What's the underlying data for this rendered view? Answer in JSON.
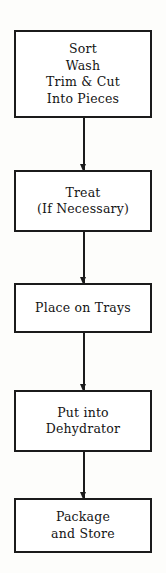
{
  "diagram": {
    "type": "flowchart",
    "orientation": "vertical",
    "box_border_color": "#1b1b1b",
    "box_fill_color": "#ffffff",
    "connector_color": "#1b1b1b",
    "page_background": "#fdfdfb",
    "nodes": [
      {
        "id": "sort-wash-trim",
        "lines": [
          "Sort",
          "Wash",
          "Trim & Cut",
          "Into Pieces"
        ]
      },
      {
        "id": "treat",
        "lines": [
          "Treat",
          "(If Necessary)"
        ]
      },
      {
        "id": "place-on-trays",
        "lines": [
          "Place on Trays"
        ]
      },
      {
        "id": "put-into-dehydrator",
        "lines": [
          "Put into",
          "Dehydrator"
        ]
      },
      {
        "id": "package-and-store",
        "lines": [
          "Package",
          "and Store"
        ]
      }
    ],
    "connectors": [
      {
        "id": "arrow-1",
        "from": "sort-wash-trim",
        "to": "treat",
        "marker": "arrowhead-down"
      },
      {
        "id": "arrow-2",
        "from": "treat",
        "to": "place-on-trays",
        "marker": "arrowhead-down"
      },
      {
        "id": "arrow-3",
        "from": "place-on-trays",
        "to": "put-into-dehydrator",
        "marker": "arrowhead-down"
      },
      {
        "id": "arrow-4",
        "from": "put-into-dehydrator",
        "to": "package-and-store",
        "marker": "arrowhead-down"
      }
    ]
  }
}
